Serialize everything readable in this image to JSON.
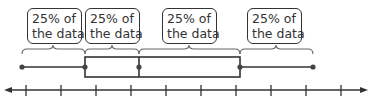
{
  "diagram": {
    "type": "box-and-whisker plot",
    "colors": {
      "stroke": "#333333",
      "background": "#ffffff",
      "bracket": "#555555"
    },
    "labels": [
      {
        "line1": "25% of",
        "line2": "the data"
      },
      {
        "line1": "25% of",
        "line2": "the data"
      },
      {
        "line1": "25% of",
        "line2": "the data"
      },
      {
        "line1": "25% of",
        "line2": "the data"
      }
    ],
    "five_number_summary_px": {
      "min": 22,
      "q1": 85,
      "median": 139,
      "q3": 240,
      "max": 313
    },
    "number_line": {
      "tick_count": 10,
      "arrows": "both"
    }
  }
}
